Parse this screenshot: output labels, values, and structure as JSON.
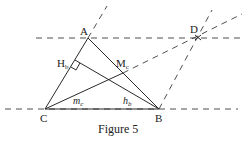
{
  "figure": {
    "caption": "Figure 5",
    "points": {
      "A": {
        "label": "A"
      },
      "B": {
        "label": "B"
      },
      "C": {
        "label": "C"
      },
      "D": {
        "label": "D"
      },
      "Hb": {
        "label": "H",
        "sub": "b"
      },
      "Mc": {
        "label": "M",
        "sub": "c"
      }
    },
    "segment_labels": {
      "mc": {
        "label": "m",
        "sub": "c"
      },
      "hb": {
        "label": "h",
        "sub": "b"
      }
    }
  }
}
